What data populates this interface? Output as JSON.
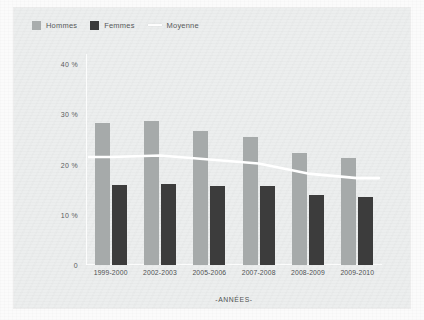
{
  "figure": {
    "legend": [
      {
        "key": "hommes",
        "label": "Hommes",
        "swatch": "square",
        "color": "#a6aaaa"
      },
      {
        "key": "femmes",
        "label": "Femmes",
        "swatch": "square",
        "color": "#3c3c3c"
      },
      {
        "key": "moyenne",
        "label": "Moyenne",
        "swatch": "line",
        "color": "#ffffff"
      }
    ],
    "xtitle": "-ANNÉES-",
    "ytick_labels": [
      "40 %",
      "30 %",
      "20 %",
      "10 %",
      "0"
    ]
  },
  "chart_data": {
    "type": "bar",
    "title": "",
    "subtitle": "",
    "xlabel": "-ANNÉES-",
    "ylabel": "",
    "categories": [
      "1999-2000",
      "2002-2003",
      "2005-2006",
      "2007-2008",
      "2008-2009",
      "2009-2010"
    ],
    "series": [
      {
        "name": "Hommes",
        "type": "bar",
        "color": "#a6aaaa",
        "values": [
          28.2,
          28.6,
          26.6,
          25.4,
          22.3,
          21.4
        ]
      },
      {
        "name": "Femmes",
        "type": "bar",
        "color": "#3c3c3c",
        "values": [
          16.0,
          16.2,
          15.8,
          15.8,
          14.0,
          13.5
        ]
      },
      {
        "name": "Moyenne",
        "type": "line",
        "color": "#ffffff",
        "values": [
          21.5,
          21.8,
          21.0,
          20.2,
          18.2,
          17.3
        ]
      }
    ],
    "ylim": [
      0,
      42
    ],
    "yticks": [
      0,
      10,
      20,
      30,
      40
    ],
    "ytick_labels": [
      "0",
      "10 %",
      "20 %",
      "30 %",
      "40 %"
    ],
    "grid": false,
    "legend_position": "top-left",
    "units": "percent"
  }
}
